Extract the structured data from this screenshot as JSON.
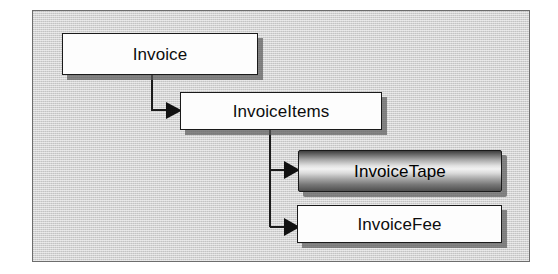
{
  "diagram": {
    "frame": {
      "background_color": "#d3d3d3",
      "border_color": "#6d6d6d"
    },
    "nodes": [
      {
        "id": "invoice",
        "label": "Invoice",
        "style": "plain",
        "fill_color": "#fdfdfd",
        "text_color": "#0d0d0d"
      },
      {
        "id": "invoiceitems",
        "label": "InvoiceItems",
        "style": "plain",
        "fill_color": "#fdfdfd",
        "text_color": "#0d0d0d"
      },
      {
        "id": "invoicetape",
        "label": "InvoiceTape",
        "style": "metallic",
        "fill_color": "#a8a8a8",
        "text_color": "#000000"
      },
      {
        "id": "invoicefee",
        "label": "InvoiceFee",
        "style": "plain",
        "fill_color": "#fdfdfd",
        "text_color": "#0d0d0d"
      }
    ],
    "connectors": [
      {
        "id": "invoice-to-invoiceitems",
        "from": "invoice",
        "to": "invoiceitems",
        "arrow": "filled-triangle-right"
      },
      {
        "id": "invoiceitems-to-invoicetape",
        "from": "invoiceitems",
        "to": "invoicetape",
        "arrow": "filled-triangle-right"
      },
      {
        "id": "invoiceitems-to-invoicefee",
        "from": "invoiceitems",
        "to": "invoicefee",
        "arrow": "filled-triangle-right"
      }
    ],
    "connector_color": "#1a1a1a"
  }
}
